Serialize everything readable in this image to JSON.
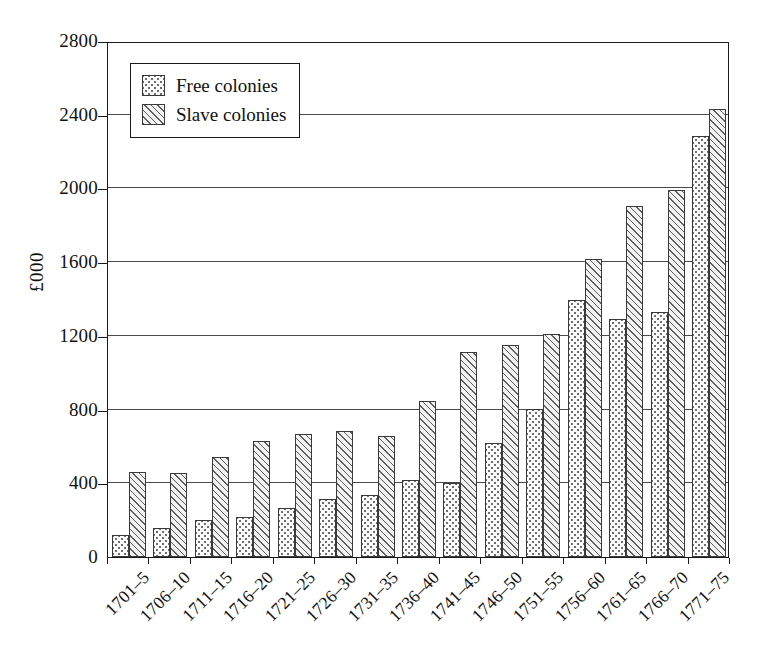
{
  "chart_data": {
    "type": "bar",
    "title": "",
    "xlabel": "",
    "ylabel": "£000",
    "ylim": [
      0,
      2800
    ],
    "yticks": [
      0,
      400,
      800,
      1200,
      1600,
      2000,
      2400,
      2800
    ],
    "ytick_labels": [
      "0",
      "400",
      "800",
      "1200",
      "1600",
      "2000",
      "2400",
      "2800"
    ],
    "grid": true,
    "legend_position": "upper left",
    "categories": [
      "1701–5",
      "1706–10",
      "1711–15",
      "1716–20",
      "1721–25",
      "1726–30",
      "1731–35",
      "1736–40",
      "1741–45",
      "1746–50",
      "1751–55",
      "1756–60",
      "1761–65",
      "1766–70",
      "1771–75"
    ],
    "series": [
      {
        "name": "Free colonies",
        "pattern": "dotted",
        "values": [
          120,
          155,
          200,
          215,
          265,
          315,
          335,
          420,
          400,
          620,
          805,
          1395,
          1290,
          1330,
          2285
        ]
      },
      {
        "name": "Slave colonies",
        "pattern": "hatched",
        "values": [
          460,
          455,
          545,
          630,
          665,
          685,
          655,
          845,
          1115,
          1150,
          1210,
          1615,
          1905,
          1990,
          2430
        ]
      }
    ]
  },
  "legend": {
    "items": [
      {
        "label": "Free colonies",
        "swatch": "dotted-swatch"
      },
      {
        "label": "Slave colonies",
        "swatch": "hatched-swatch"
      }
    ]
  },
  "colors": {
    "axis": "#1a1a1a",
    "grid": "#4a4a4a",
    "bar_outline": "#3a3a3a",
    "background": "#ffffff"
  }
}
